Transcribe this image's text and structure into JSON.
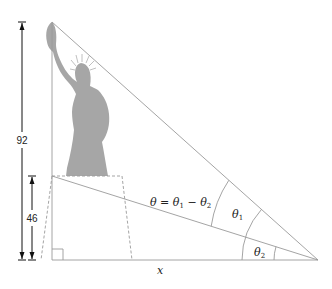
{
  "diagram": {
    "type": "statue-angle-of-elevation",
    "colors": {
      "statue_fill": "#a6a6a6",
      "line": "#9a9a9a",
      "dim_line": "#111111",
      "text": "#222222"
    },
    "dimensions": {
      "total_height_label": "92",
      "pedestal_height_label": "46",
      "horizontal_distance_label": "x"
    },
    "angles": {
      "theta_equation": {
        "lhs": "θ",
        "eq": " = ",
        "t1": "θ",
        "t1_sub": "1",
        "minus": " − ",
        "t2": "θ",
        "t2_sub": "2"
      },
      "theta1": {
        "sym": "θ",
        "sub": "1"
      },
      "theta2": {
        "sym": "θ",
        "sub": "2"
      }
    },
    "annotations": {
      "right_angle_marker": true
    }
  }
}
